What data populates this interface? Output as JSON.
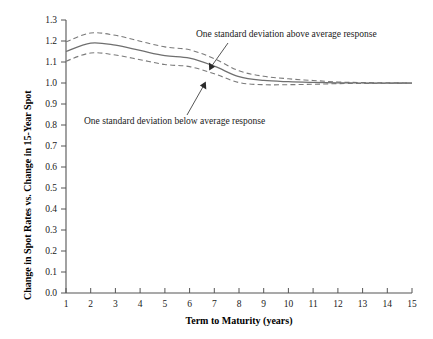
{
  "chart_data": {
    "type": "line",
    "title": "",
    "xlabel": "Term to Maturity (years)",
    "ylabel": "Change in Spot Rates vs. Change in 15-Year Spot",
    "xlim": [
      1,
      15
    ],
    "ylim": [
      0.0,
      1.3
    ],
    "grid": false,
    "legend": "none",
    "x": [
      1,
      2,
      3,
      4,
      5,
      6,
      7,
      8,
      9,
      10,
      11,
      12,
      13,
      14,
      15
    ],
    "xticklabels": [
      "1",
      "2",
      "3",
      "4",
      "5",
      "6",
      "7",
      "8",
      "9",
      "10",
      "11",
      "12",
      "13",
      "14",
      "15"
    ],
    "yticklabels": [
      "0.0",
      "0.1",
      "0.2",
      "0.3",
      "0.4",
      "0.5",
      "0.6",
      "0.7",
      "0.8",
      "0.9",
      "1.0",
      "1.1",
      "1.2",
      "1.3"
    ],
    "yticks": [
      0.0,
      0.1,
      0.2,
      0.3,
      0.4,
      0.5,
      0.6,
      0.7,
      0.8,
      0.9,
      1.0,
      1.1,
      1.2,
      1.3
    ],
    "series": [
      {
        "name": "Average response",
        "style": "solid",
        "values": [
          1.15,
          1.19,
          1.18,
          1.155,
          1.13,
          1.118,
          1.08,
          1.03,
          1.012,
          1.006,
          1.003,
          1.001,
          1.0,
          1.0,
          1.0
        ]
      },
      {
        "name": "One standard deviation above average response",
        "style": "dashed",
        "values": [
          1.196,
          1.238,
          1.227,
          1.199,
          1.172,
          1.158,
          1.116,
          1.058,
          1.032,
          1.02,
          1.012,
          1.005,
          1.002,
          1.001,
          1.0
        ]
      },
      {
        "name": "One standard deviation below average response",
        "style": "dashed",
        "values": [
          1.104,
          1.143,
          1.133,
          1.111,
          1.088,
          1.078,
          1.044,
          1.002,
          0.992,
          0.992,
          0.994,
          0.997,
          0.998,
          0.999,
          1.0
        ]
      }
    ],
    "annotations": [
      {
        "text": "One standard deviation above average response",
        "target_x": 7.0,
        "target_y": 1.115
      },
      {
        "text": "One standard deviation below average response",
        "target_x": 6.55,
        "target_y": 1.062
      }
    ]
  },
  "axes": {
    "xlabel": "Term to Maturity (years)",
    "ylabel": "Change in Spot Rates vs. Change in 15-Year Spot"
  },
  "yticks": {
    "t0": "0.0",
    "t1": "0.1",
    "t2": "0.2",
    "t3": "0.3",
    "t4": "0.4",
    "t5": "0.5",
    "t6": "0.6",
    "t7": "0.7",
    "t8": "0.8",
    "t9": "0.9",
    "t10": "1.0",
    "t11": "1.1",
    "t12": "1.2",
    "t13": "1.3"
  },
  "xticks": {
    "t1": "1",
    "t2": "2",
    "t3": "3",
    "t4": "4",
    "t5": "5",
    "t6": "6",
    "t7": "7",
    "t8": "8",
    "t9": "9",
    "t10": "10",
    "t11": "11",
    "t12": "12",
    "t13": "13",
    "t14": "14",
    "t15": "15"
  },
  "annotations": {
    "above": "One standard deviation above average response",
    "below": "One standard deviation below average response"
  },
  "colors": {
    "mean_line": "#6f6f6f",
    "band_line": "#7a7a7a",
    "axis": "#555555",
    "text": "#1a1a1a",
    "background": "#ffffff"
  }
}
